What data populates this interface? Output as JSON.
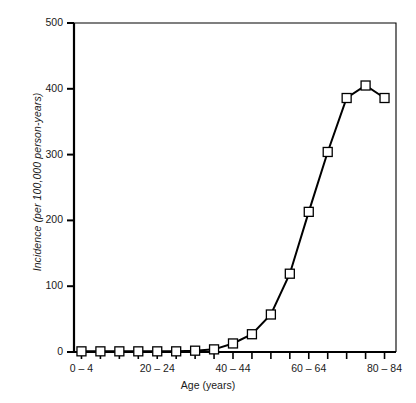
{
  "chart_data": {
    "type": "line",
    "title": "",
    "subtitle": "",
    "xlabel": "Age (years)",
    "ylabel": "Incidence (per 100,000 person-years)",
    "categories": [
      "0 – 4",
      "5 – 9",
      "10 – 14",
      "15 – 19",
      "20 – 24",
      "25 – 29",
      "30 – 34",
      "35 – 39",
      "40 – 44",
      "45 – 49",
      "50 – 54",
      "55 – 59",
      "60 – 64",
      "65 – 69",
      "70 – 74",
      "75 – 79",
      "80 – 84"
    ],
    "values": [
      1,
      1,
      1,
      1,
      1,
      1,
      2,
      4,
      13,
      27,
      57,
      119,
      213,
      304,
      386,
      405,
      386
    ],
    "series": [
      {
        "name": "Incidence",
        "values": [
          1,
          1,
          1,
          1,
          1,
          1,
          2,
          4,
          13,
          27,
          57,
          119,
          213,
          304,
          386,
          405,
          386
        ]
      }
    ],
    "ylim": [
      0,
      500
    ],
    "yticks": [
      0,
      100,
      200,
      300,
      400,
      500
    ],
    "ytick_labels": [
      "0",
      "100",
      "200",
      "300",
      "400",
      "500"
    ],
    "xtick_labels_shown": [
      "0 – 4",
      "20 – 24",
      "40 – 44",
      "60 – 64",
      "80 – 84"
    ],
    "xtick_label_indices": [
      0,
      4,
      8,
      12,
      16
    ],
    "grid": false,
    "legend": false,
    "legend_position": "none",
    "marker": "open-square",
    "marker_face_color": "#ffffff",
    "line_color": "#000000",
    "axis_color": "#000000",
    "background_color": "#ffffff"
  }
}
